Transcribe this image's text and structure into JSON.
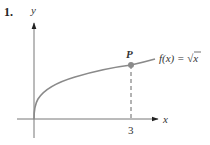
{
  "problem_number": "1.",
  "axes": {
    "x_label": "x",
    "y_label": "y",
    "x_tick": "3"
  },
  "point": {
    "label": "P",
    "x": 3,
    "y": 1.732
  },
  "function_label": "f(x) = √x",
  "function_label_parts": {
    "lhs": "f(x) = ",
    "radical": "√",
    "arg": "x"
  },
  "colors": {
    "curve": "#8a8a8a",
    "axes": "#777777",
    "point": "#8a8a8a",
    "dashed": "#555555",
    "text": "#333333"
  }
}
